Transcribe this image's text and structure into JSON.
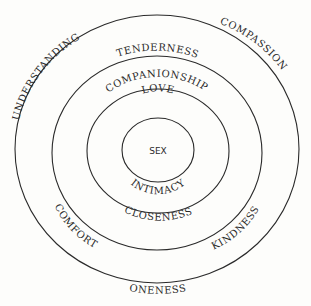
{
  "diagram": {
    "type": "concentric-circles",
    "center": "SEX",
    "rings": [
      {
        "level": 1,
        "labels": {
          "top": "LOVE",
          "bottom": "INTIMACY"
        }
      },
      {
        "level": 2,
        "labels": {
          "top": "COMPANIONSHIP",
          "bottom": "CLOSENESS"
        }
      },
      {
        "level": 3,
        "labels": {
          "top": "TENDERNESS",
          "bottom_left": "COMFORT",
          "bottom_right": "KINDNESS"
        }
      },
      {
        "level": 4,
        "labels": {
          "top_left": "UNDERSTANDING",
          "top_right": "COMPASSION",
          "bottom": "ONENESS"
        }
      }
    ],
    "colors": {
      "line": "#2a2a2a",
      "background": "#fdfdfb"
    }
  }
}
